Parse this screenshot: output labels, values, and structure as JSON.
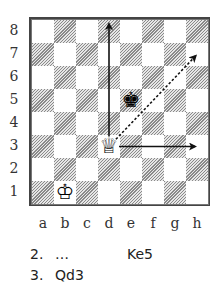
{
  "board": {
    "files": [
      "a",
      "b",
      "c",
      "d",
      "e",
      "f",
      "g",
      "h"
    ],
    "ranks": [
      "8",
      "7",
      "6",
      "5",
      "4",
      "3",
      "2",
      "1"
    ],
    "colors": {
      "light": "#ffffff",
      "dark_hatch": "#8a8a8a",
      "frame": "#444444"
    },
    "pieces": [
      {
        "square": "d3",
        "piece": "white-queen",
        "glyph": "♕"
      },
      {
        "square": "e5",
        "piece": "black-king",
        "glyph": "♚"
      },
      {
        "square": "b1",
        "piece": "white-king",
        "glyph": "♔"
      }
    ],
    "arrows": [
      {
        "from": "d3",
        "to": "d8",
        "style": "solid"
      },
      {
        "from": "d3",
        "to": "h3",
        "style": "solid"
      },
      {
        "from": "d3",
        "to": "h7",
        "style": "dotted"
      }
    ]
  },
  "moves": [
    {
      "number": "2.",
      "white": "…",
      "black": "Ke5"
    },
    {
      "number": "3.",
      "white": "Qd3",
      "black": ""
    }
  ]
}
